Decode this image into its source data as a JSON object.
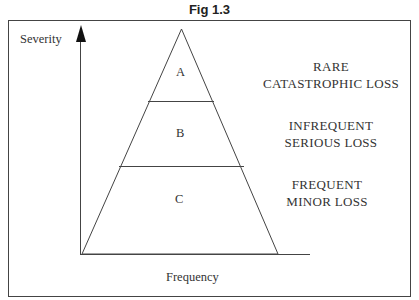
{
  "figure": {
    "title": "Fig 1.3",
    "y_axis_label": "Severity",
    "x_axis_label": "Frequency",
    "tiers": [
      {
        "id": "A",
        "description_line1": "RARE",
        "description_line2": "CATASTROPHIC LOSS"
      },
      {
        "id": "B",
        "description_line1": "INFREQUENT",
        "description_line2": "SERIOUS LOSS"
      },
      {
        "id": "C",
        "description_line1": "FREQUENT",
        "description_line2": "MINOR LOSS"
      }
    ]
  }
}
